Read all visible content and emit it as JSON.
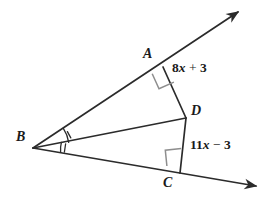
{
  "figure": {
    "type": "geometry-diagram",
    "background_color": "#ffffff",
    "stroke_color": "#2b2b2b",
    "label_color": "#1a1a1a"
  },
  "points": {
    "B": {
      "label": "B",
      "x": 33,
      "y": 148,
      "label_x": 16,
      "label_y": 130
    },
    "A": {
      "label": "A",
      "x": 163,
      "y": 67,
      "label_x": 143,
      "label_y": 47
    },
    "C": {
      "label": "C",
      "x": 180,
      "y": 173,
      "label_x": 163,
      "label_y": 176
    },
    "D": {
      "label": "D",
      "x": 186,
      "y": 118,
      "label_x": 191,
      "label_y": 104
    }
  },
  "rays": {
    "upper_ray_tip": {
      "x": 243,
      "y": 8
    },
    "lower_ray_tip": {
      "x": 262,
      "y": 189
    }
  },
  "segments": [
    {
      "name": "ray-BA",
      "from": "B",
      "to": "upper-arrow"
    },
    {
      "name": "ray-BC",
      "from": "B",
      "to": "lower-arrow"
    },
    {
      "name": "segment-BD",
      "from": "B",
      "to": "D"
    },
    {
      "name": "segment-AD",
      "from": "A",
      "to": "D"
    },
    {
      "name": "segment-DC",
      "from": "D",
      "to": "C"
    }
  ],
  "measures": {
    "upper": {
      "name": "segment-AD-length",
      "coefficient": "8",
      "variable": "x",
      "operator": "+",
      "constant": "3",
      "text": "8x + 3",
      "x": 172,
      "y": 61
    },
    "lower": {
      "name": "segment-DC-length",
      "coefficient": "11",
      "variable": "x",
      "operator": "−",
      "constant": "3",
      "text": "11x − 3",
      "x": 190,
      "y": 138
    }
  },
  "angle_marks": {
    "vertex_b_upper": {
      "name": "angle-ABD",
      "radius": 36,
      "ticks": 1,
      "congruent_group": "1"
    },
    "vertex_b_lower": {
      "name": "angle-DBC",
      "radius": 29,
      "ticks": 1,
      "congruent_group": "1"
    },
    "right_angle_a": {
      "name": "right-angle-at-A",
      "size": 15,
      "symbol": "square"
    },
    "right_angle_c": {
      "name": "right-angle-at-C",
      "size": 15,
      "symbol": "square"
    }
  }
}
